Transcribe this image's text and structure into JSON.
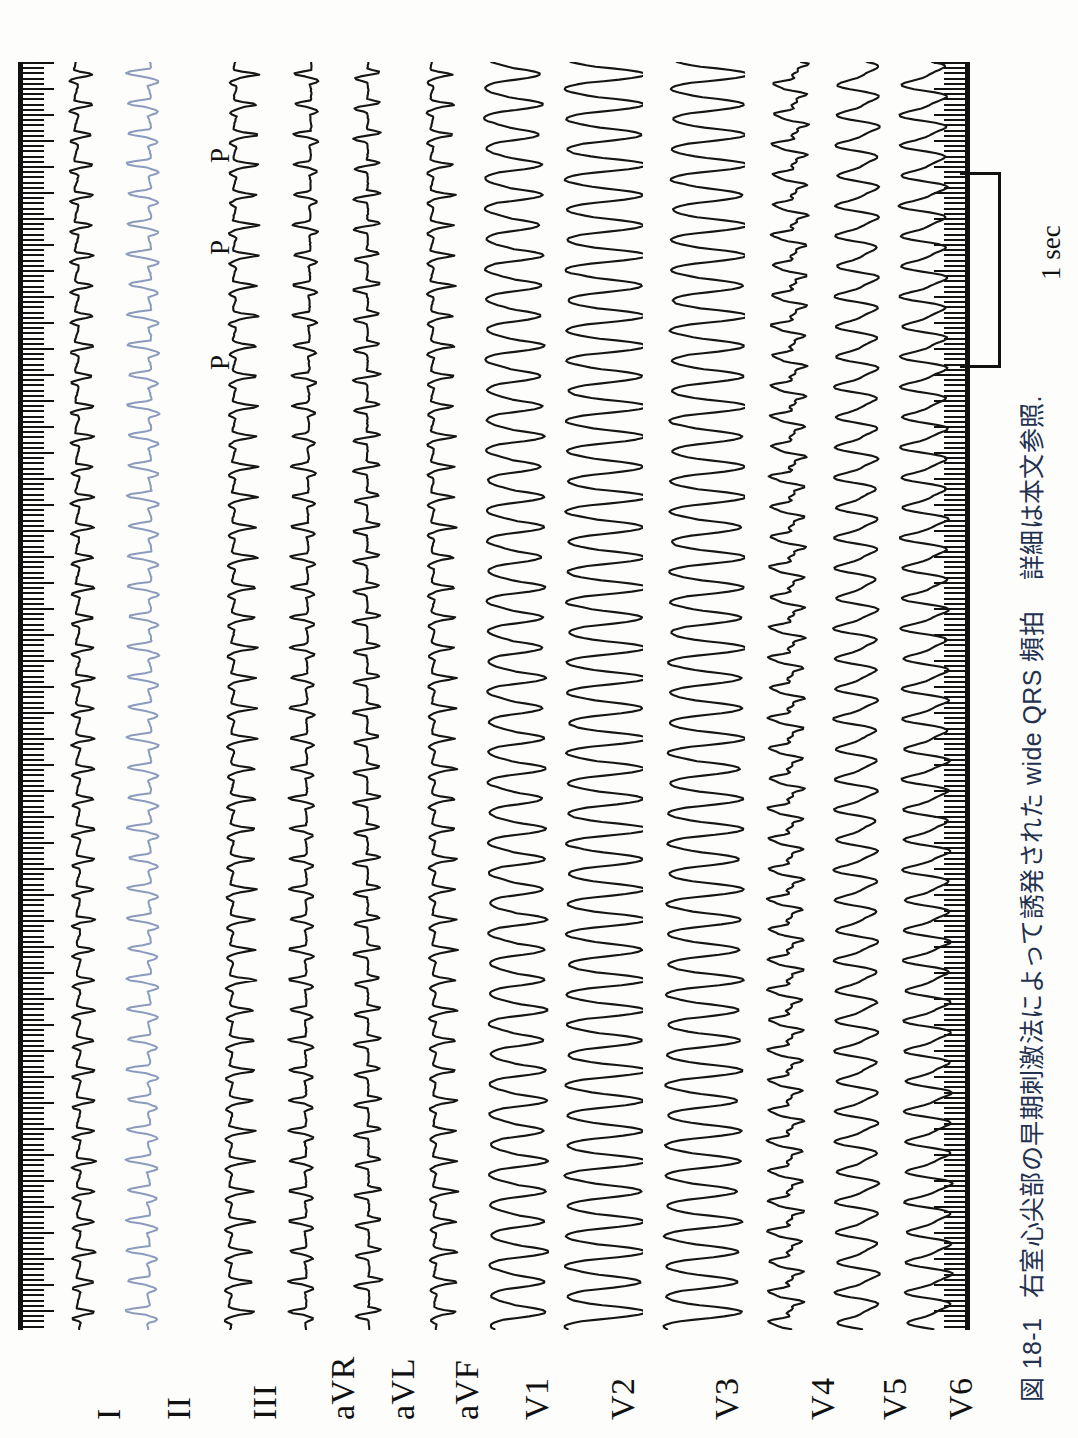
{
  "figure": {
    "number": "図 18-1",
    "title": "右室心尖部の早期刺激法によって誘発された wide QRS 頻拍",
    "note": "詳細は本文参照."
  },
  "scale": {
    "label": "1 sec",
    "seconds": 1
  },
  "annotations": {
    "p_waves": [
      "P",
      "P",
      "P"
    ]
  },
  "ecg": {
    "type": "ecg-strip",
    "orientation": "rotated-90-ccw",
    "paper_speed_note": "1 sec scale bar shown at right",
    "leads": [
      {
        "name": "I",
        "label": "I",
        "color": "#151515",
        "x": 58,
        "amp": 17,
        "morph": "spiky-biphasic"
      },
      {
        "name": "II",
        "label": "II",
        "color": "#8b9bbd",
        "x": 128,
        "amp": 22,
        "morph": "deep-negative"
      },
      {
        "name": "III",
        "label": "III",
        "color": "#151515",
        "x": 214,
        "amp": 19,
        "morph": "notched-positive"
      },
      {
        "name": "aVR",
        "label": "aVR",
        "color": "#151515",
        "x": 292,
        "amp": 16,
        "morph": "sharp-negative"
      },
      {
        "name": "aVL",
        "label": "aVL",
        "color": "#151515",
        "x": 352,
        "amp": 16,
        "morph": "sharp-biphasic"
      },
      {
        "name": "aVF",
        "label": "aVF",
        "color": "#151515",
        "x": 416,
        "amp": 18,
        "morph": "notched-positive"
      },
      {
        "name": "V1",
        "label": "V1",
        "color": "#151515",
        "x": 486,
        "amp": 30,
        "morph": "broad-monophasic"
      },
      {
        "name": "V2",
        "label": "V2",
        "color": "#151515",
        "x": 572,
        "amp": 38,
        "morph": "broad-monophasic-large"
      },
      {
        "name": "V3",
        "label": "V3",
        "color": "#151515",
        "x": 676,
        "amp": 36,
        "morph": "broad-monophasic-large"
      },
      {
        "name": "V4",
        "label": "V4",
        "color": "#151515",
        "x": 772,
        "amp": 22,
        "morph": "serrated-rapid"
      },
      {
        "name": "V5",
        "label": "V5",
        "color": "#151515",
        "x": 844,
        "amp": 24,
        "morph": "sinusoidal"
      },
      {
        "name": "V6",
        "label": "V6",
        "color": "#151515",
        "x": 910,
        "amp": 26,
        "morph": "sinusoidal"
      }
    ],
    "beats": 42,
    "rhythm": "wide QRS tachycardia"
  }
}
